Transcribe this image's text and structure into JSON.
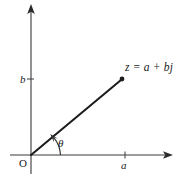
{
  "figure": {
    "kind": "argand-diagram",
    "background_color": "#ffffff",
    "stroke_color": "#2b2b2b",
    "vector_color": "#1d1d1d"
  },
  "labels": {
    "point_label": "z = a + bj",
    "origin_label": "O",
    "x_tick_label": "a",
    "y_tick_label": "b",
    "angle_label": "θ"
  },
  "axes": {
    "x_axis": {
      "name": "real-axis",
      "from_x": 10,
      "to_x": 172,
      "y": 155,
      "arrow": "right"
    },
    "y_axis": {
      "name": "imaginary-axis",
      "x": 31,
      "from_y": 174,
      "to_y": 5,
      "arrow": "up"
    },
    "origin": {
      "x": 31,
      "y": 155
    }
  },
  "geometry": {
    "point_z": {
      "x": 122,
      "y": 79
    },
    "x_tick": {
      "x": 125,
      "y": 155
    },
    "y_tick": {
      "x": 31,
      "y": 79
    },
    "angle_degrees": 38
  }
}
